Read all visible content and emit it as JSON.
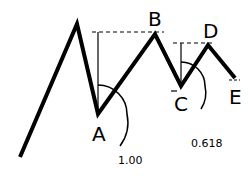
{
  "diagram": {
    "type": "elliott-wave-abcde",
    "points": {
      "start": [
        20,
        157
      ],
      "peak": [
        77,
        24
      ],
      "A": [
        98,
        114
      ],
      "B": [
        155,
        34
      ],
      "C": [
        181,
        86
      ],
      "D": [
        208,
        45
      ],
      "E": [
        235,
        78
      ]
    },
    "labels": {
      "A": "A",
      "B": "B",
      "C": "C",
      "D": "D",
      "E": "E"
    },
    "ratios": {
      "first": "1.00",
      "second": "0.618"
    },
    "colors": {
      "line": "#000000",
      "background": "#ffffff"
    }
  }
}
